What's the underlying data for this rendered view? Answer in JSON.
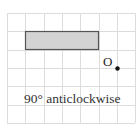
{
  "diagram": {
    "type": "grid-rotation-exercise",
    "grid": {
      "columns": 7,
      "rows": 6,
      "origin_px": [
        7,
        13
      ],
      "cell_px": 18.3,
      "line_color": "#dcdcdc"
    },
    "shape": {
      "kind": "rectangle",
      "grid_x": 1,
      "grid_y": 1,
      "grid_w": 4,
      "grid_h": 1,
      "fill": "#d3d3d3",
      "stroke": "#555555"
    },
    "point": {
      "label": "O",
      "grid_x": 6,
      "grid_y": 3,
      "color": "#111111"
    },
    "caption": "90° anticlockwise"
  }
}
